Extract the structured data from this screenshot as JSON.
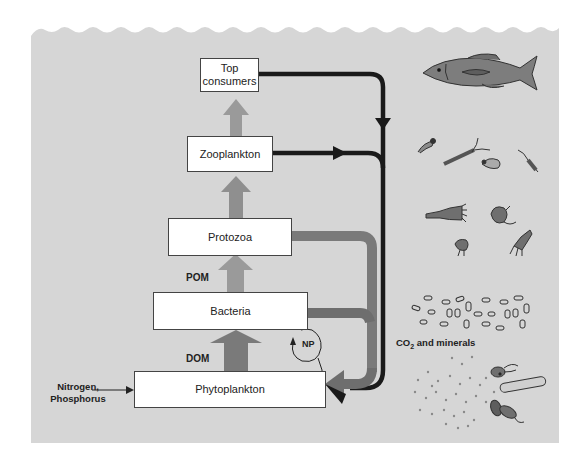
{
  "diagram": {
    "nodes": [
      {
        "id": "top",
        "label_line1": "Top",
        "label_line2": "consumers"
      },
      {
        "id": "zoo",
        "label": "Zooplankton"
      },
      {
        "id": "proto",
        "label": "Protozoa"
      },
      {
        "id": "bact",
        "label": "Bacteria"
      },
      {
        "id": "phyto",
        "label": "Phytoplankton"
      }
    ],
    "labels": {
      "pom": "POM",
      "dom": "DOM",
      "np": "NP",
      "nutrients_line1": "Nitrogen,",
      "nutrients_line2": "Phosphorus",
      "co2_prefix": "CO",
      "co2_sub": "2",
      "co2_suffix": " and minerals"
    },
    "edges": [
      {
        "from": "Phytoplankton",
        "to": "Bacteria",
        "label": "DOM"
      },
      {
        "from": "Bacteria",
        "to": "Protozoa",
        "label": "POM"
      },
      {
        "from": "Protozoa",
        "to": "Zooplankton"
      },
      {
        "from": "Zooplankton",
        "to": "Top consumers"
      },
      {
        "from": "Top consumers",
        "to": "Phytoplankton",
        "via": "CO2 and minerals"
      },
      {
        "from": "Zooplankton",
        "to": "Phytoplankton",
        "via": "CO2 and minerals"
      },
      {
        "from": "Protozoa",
        "to": "Phytoplankton",
        "via": "CO2 and minerals"
      },
      {
        "from": "Bacteria",
        "to": "Phytoplankton",
        "via": "CO2 and minerals"
      },
      {
        "from": "Bacteria",
        "to": "Phytoplankton",
        "label": "NP"
      },
      {
        "from": "Nitrogen, Phosphorus",
        "to": "Phytoplankton"
      }
    ],
    "illustrations": [
      "fish",
      "zooplankton-copepods",
      "protozoa-ciliates",
      "bacteria-rods",
      "dissolved-particles-and-phytoplankton-cells"
    ],
    "colors": {
      "water": "#d6d6d6",
      "box_fill": "#ffffff",
      "dark_arrow": "#1a1a1a",
      "mid_arrow": "#7a7a7a",
      "light_arrow": "#9a9a9a",
      "organism_fill": "#7d7d7d"
    }
  }
}
